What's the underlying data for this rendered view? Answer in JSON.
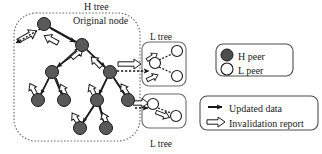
{
  "figure": {
    "title_labels": {
      "h_tree": "H tree",
      "original_node": "Original node",
      "l_tree_top": "L tree",
      "l_tree_bottom": "L tree"
    },
    "legend_peers": {
      "h_peer": "H peer",
      "l_peer": "L peer",
      "h_peer_color": "#4d4d4d",
      "l_peer_color": "#ffffff"
    },
    "legend_arrows": {
      "updated_data": "Updated data",
      "invalidation_report": "Invalidation report",
      "updated_data_color": "#1a1a1a",
      "invalidation_report_color": "#ffffff"
    },
    "colors": {
      "node_fill": "#595959",
      "node_stroke": "#1a1a1a",
      "container_stroke": "#4d4d4d",
      "background": "#ffffff"
    },
    "h_tree_nodes": [
      {
        "id": "root",
        "x": 44,
        "y": 24,
        "r": 6.5,
        "type": "H peer"
      },
      {
        "id": "n2",
        "x": 82,
        "y": 45,
        "r": 6.5,
        "type": "H peer"
      },
      {
        "id": "n3",
        "x": 52,
        "y": 72,
        "r": 6.5,
        "type": "H peer"
      },
      {
        "id": "n4",
        "x": 110,
        "y": 72,
        "r": 6.5,
        "type": "H peer"
      },
      {
        "id": "n5",
        "x": 38,
        "y": 100,
        "r": 6.5,
        "type": "H peer"
      },
      {
        "id": "n6",
        "x": 64,
        "y": 100,
        "r": 6.5,
        "type": "H peer"
      },
      {
        "id": "n7",
        "x": 97,
        "y": 100,
        "r": 6.5,
        "type": "H peer"
      },
      {
        "id": "n8",
        "x": 128,
        "y": 100,
        "r": 6.5,
        "type": "H peer"
      },
      {
        "id": "n9",
        "x": 80,
        "y": 128,
        "r": 6.5,
        "type": "H peer"
      },
      {
        "id": "n10",
        "x": 106,
        "y": 128,
        "r": 6.5,
        "type": "H peer"
      }
    ],
    "h_tree_edges": [
      {
        "from": "root",
        "to": "n2"
      },
      {
        "from": "n2",
        "to": "n3"
      },
      {
        "from": "n2",
        "to": "n4"
      },
      {
        "from": "n3",
        "to": "n5"
      },
      {
        "from": "n3",
        "to": "n6"
      },
      {
        "from": "n4",
        "to": "n7"
      },
      {
        "from": "n4",
        "to": "n8"
      },
      {
        "from": "n7",
        "to": "n9"
      },
      {
        "from": "n7",
        "to": "n10"
      }
    ],
    "l_tree_top_nodes": [
      {
        "id": "lt_root",
        "x": 155,
        "y": 63,
        "r": 5.5,
        "type": "L peer"
      },
      {
        "id": "lt_a",
        "x": 177,
        "y": 51,
        "r": 5.5,
        "type": "L peer"
      },
      {
        "id": "lt_b",
        "x": 177,
        "y": 76,
        "r": 5.5,
        "type": "L peer"
      }
    ],
    "l_tree_bottom_nodes": [
      {
        "id": "lb_root",
        "x": 153,
        "y": 104,
        "r": 5.5,
        "type": "L peer"
      },
      {
        "id": "lb_a",
        "x": 176,
        "y": 116,
        "r": 5.5,
        "type": "L peer"
      }
    ]
  }
}
